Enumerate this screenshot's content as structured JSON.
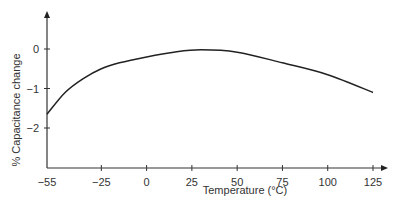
{
  "chart_data": {
    "type": "line",
    "title": "",
    "xlabel": "Temperature (°C)",
    "ylabel": "% Capacitance change",
    "x_ticks": [
      -55,
      -25,
      0,
      25,
      50,
      75,
      100,
      125
    ],
    "y_ticks": [
      0,
      -1,
      -2
    ],
    "xlim": [
      -55,
      130
    ],
    "ylim": [
      -3,
      0.8
    ],
    "grid": false,
    "legend": null,
    "series": [
      {
        "name": "Capacitance change",
        "x": [
          -55,
          -45,
          -35,
          -25,
          -15,
          0,
          15,
          30,
          50,
          75,
          100,
          125
        ],
        "y": [
          -1.65,
          -1.1,
          -0.75,
          -0.5,
          -0.35,
          -0.2,
          -0.08,
          -0.02,
          -0.08,
          -0.35,
          -0.65,
          -1.1
        ]
      }
    ]
  }
}
